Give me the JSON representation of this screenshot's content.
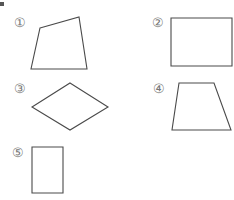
{
  "figures": [
    {
      "label": "①",
      "type": "irregular-quadrilateral",
      "points": "40,28 79,17 87,69 31,69",
      "label_x": 14,
      "label_y": 27
    },
    {
      "label": "②",
      "type": "rectangle",
      "points": "171,18 232,18 232,66 171,66",
      "label_x": 152,
      "label_y": 27
    },
    {
      "label": "③",
      "type": "rhombus",
      "points": "70,83 108,107 70,130 32,107",
      "label_x": 14,
      "label_y": 93
    },
    {
      "label": "④",
      "type": "trapezoid",
      "points": "179,83 214,83 231,130 172,130",
      "label_x": 153,
      "label_y": 93
    },
    {
      "label": "⑤",
      "type": "rectangle",
      "points": "32,147 63,147 63,193 32,193",
      "label_x": 12,
      "label_y": 157
    }
  ],
  "colors": {
    "stroke": "#4a4a4a",
    "label": "#777777"
  }
}
